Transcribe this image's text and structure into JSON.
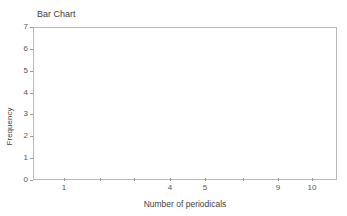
{
  "figure": {
    "cropped_header_text": "",
    "title": "Bar Chart",
    "background_color": "#ffffff",
    "frame_color": "#b9b9bd"
  },
  "chart_data": {
    "type": "bar",
    "title": "Bar Chart",
    "xlabel": "Number of periodicals",
    "ylabel": "Frequency",
    "categories": [
      "1",
      "",
      "",
      "4",
      "5",
      "",
      "9",
      "10"
    ],
    "values": [
      0,
      0,
      0,
      0,
      0,
      0,
      0,
      0
    ],
    "series": [
      {
        "name": "Frequency",
        "values": [
          0,
          0,
          0,
          0,
          0,
          0,
          0,
          0
        ]
      }
    ],
    "x_tick_labels": [
      "1",
      "",
      "",
      "4",
      "5",
      "",
      "9",
      "10"
    ],
    "y_tick_labels": [
      "0",
      "1",
      "2",
      "3",
      "4",
      "5",
      "6",
      "7"
    ],
    "ylim": [
      0,
      7
    ],
    "y_step": 1,
    "grid": false,
    "legend": false,
    "bars_rendered": false,
    "note": "Empty plot area — no bars drawn"
  },
  "yaxis": {
    "ticks": [
      {
        "label": "7",
        "value": 7
      },
      {
        "label": "6",
        "value": 6
      },
      {
        "label": "5",
        "value": 5
      },
      {
        "label": "4",
        "value": 4
      },
      {
        "label": "3",
        "value": 3
      },
      {
        "label": "2",
        "value": 2
      },
      {
        "label": "1",
        "value": 1
      },
      {
        "label": "0",
        "value": 0
      }
    ],
    "title": "Frequency"
  },
  "xaxis": {
    "ticks": [
      {
        "label": "1",
        "pos": 31
      },
      {
        "label": "",
        "pos": 67
      },
      {
        "label": "",
        "pos": 101
      },
      {
        "label": "4",
        "pos": 137
      },
      {
        "label": "5",
        "pos": 172
      },
      {
        "label": "",
        "pos": 210
      },
      {
        "label": "9",
        "pos": 245
      },
      {
        "label": "10",
        "pos": 279
      }
    ],
    "title": "Number of periodicals"
  }
}
